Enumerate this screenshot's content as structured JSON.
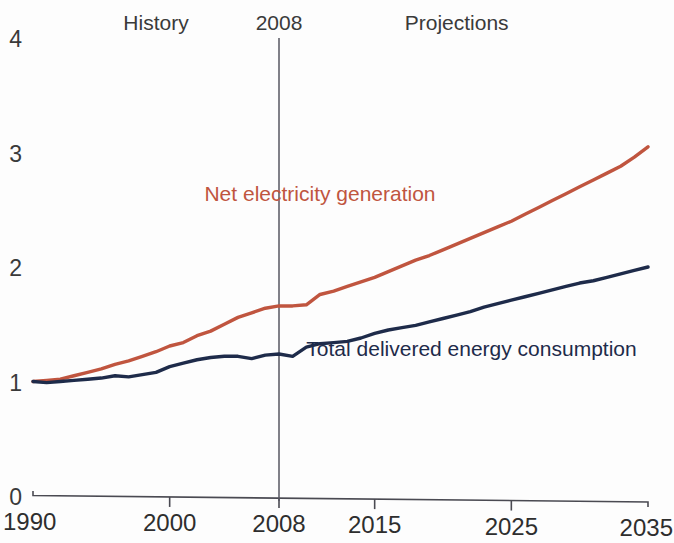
{
  "chart_data": {
    "type": "line",
    "title": "",
    "subtitle": "",
    "xlabel": "",
    "ylabel": "",
    "xlim": [
      1990,
      2035
    ],
    "ylim": [
      0,
      4
    ],
    "grid": false,
    "legend_position": "inline-labels",
    "xticks": [
      1990,
      2000,
      2008,
      2015,
      2025,
      2035
    ],
    "xtick_labels": [
      "1990",
      "2000",
      "2008",
      "2015",
      "2025",
      "2035"
    ],
    "yticks": [
      0,
      1,
      2,
      3,
      4
    ],
    "ytick_labels": [
      "0",
      "1",
      "2",
      "3",
      "4"
    ],
    "annotations": [
      {
        "text": "History",
        "x": 1999,
        "y": 3.95
      },
      {
        "text": "2008",
        "x": 2008,
        "y": 3.95
      },
      {
        "text": "Projections",
        "x": 2021,
        "y": 3.95
      }
    ],
    "divider": {
      "x": 2008,
      "label": "2008"
    },
    "series": [
      {
        "name": "Net electricity generation",
        "color": "#c0553f",
        "label_x": 2011,
        "label_y": 2.58,
        "x": [
          1990,
          1991,
          1992,
          1993,
          1994,
          1995,
          1996,
          1997,
          1998,
          1999,
          2000,
          2001,
          2002,
          2003,
          2004,
          2005,
          2006,
          2007,
          2008,
          2009,
          2010,
          2011,
          2012,
          2013,
          2014,
          2015,
          2016,
          2017,
          2018,
          2019,
          2020,
          2021,
          2022,
          2023,
          2024,
          2025,
          2026,
          2027,
          2028,
          2029,
          2030,
          2031,
          2032,
          2033,
          2034,
          2035
        ],
        "values": [
          1.0,
          1.01,
          1.02,
          1.05,
          1.08,
          1.11,
          1.15,
          1.18,
          1.22,
          1.26,
          1.31,
          1.34,
          1.4,
          1.44,
          1.5,
          1.56,
          1.6,
          1.64,
          1.66,
          1.66,
          1.67,
          1.76,
          1.79,
          1.83,
          1.87,
          1.91,
          1.96,
          2.01,
          2.06,
          2.1,
          2.15,
          2.2,
          2.25,
          2.3,
          2.35,
          2.4,
          2.46,
          2.52,
          2.58,
          2.64,
          2.7,
          2.76,
          2.82,
          2.88,
          2.96,
          3.05
        ]
      },
      {
        "name": "Total delivered energy consumption",
        "color": "#1e2b4a",
        "label_x": 2010,
        "label_y": 1.22,
        "x": [
          1990,
          1991,
          1992,
          1993,
          1994,
          1995,
          1996,
          1997,
          1998,
          1999,
          2000,
          2001,
          2002,
          2003,
          2004,
          2005,
          2006,
          2007,
          2008,
          2009,
          2010,
          2011,
          2012,
          2013,
          2014,
          2015,
          2016,
          2017,
          2018,
          2019,
          2020,
          2021,
          2022,
          2023,
          2024,
          2025,
          2026,
          2027,
          2028,
          2029,
          2030,
          2031,
          2032,
          2033,
          2034,
          2035
        ],
        "values": [
          1.0,
          0.99,
          1.0,
          1.01,
          1.02,
          1.03,
          1.05,
          1.04,
          1.06,
          1.08,
          1.13,
          1.16,
          1.19,
          1.21,
          1.22,
          1.22,
          1.2,
          1.23,
          1.24,
          1.22,
          1.3,
          1.33,
          1.34,
          1.35,
          1.38,
          1.42,
          1.45,
          1.47,
          1.49,
          1.52,
          1.55,
          1.58,
          1.61,
          1.65,
          1.68,
          1.71,
          1.74,
          1.77,
          1.8,
          1.83,
          1.86,
          1.88,
          1.91,
          1.94,
          1.97,
          2.0
        ]
      }
    ]
  }
}
